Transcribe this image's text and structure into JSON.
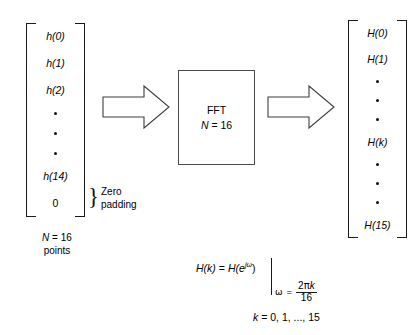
{
  "diagram": {
    "input_vector": {
      "name": "input-sequence",
      "items": [
        {
          "type": "text",
          "label": "h(0)"
        },
        {
          "type": "text",
          "label": "h(1)"
        },
        {
          "type": "text",
          "label": "h(2)"
        },
        {
          "type": "dot",
          "label": ""
        },
        {
          "type": "dot",
          "label": ""
        },
        {
          "type": "dot",
          "label": ""
        },
        {
          "type": "text",
          "label": "h(14)"
        },
        {
          "type": "zero",
          "label": "0"
        }
      ],
      "brace_symbol": "}",
      "brace_label_line1": "Zero",
      "brace_label_line2": "padding",
      "caption_line1": "N = 16",
      "caption_line2": "points",
      "caption_italic_part": "N",
      "caption_rest": " = 16"
    },
    "processor": {
      "name": "fft-block",
      "title": "FFT",
      "size_label_italic": "N",
      "size_label_rest": " = 16"
    },
    "arrows": {
      "input_arrow_label": "input-arrow",
      "output_arrow_label": "output-arrow"
    },
    "output_vector": {
      "name": "output-spectrum",
      "items": [
        {
          "type": "text",
          "label": "H(0)"
        },
        {
          "type": "text",
          "label": "H(1)"
        },
        {
          "type": "dot",
          "label": ""
        },
        {
          "type": "dot",
          "label": ""
        },
        {
          "type": "dot",
          "label": ""
        },
        {
          "type": "text",
          "label": "H(k)"
        },
        {
          "type": "dot",
          "label": ""
        },
        {
          "type": "dot",
          "label": ""
        },
        {
          "type": "dot",
          "label": ""
        },
        {
          "type": "text",
          "label": "H(15)"
        }
      ]
    },
    "equation": {
      "lhs": "H(k)",
      "equals": "=",
      "rhs_base": "H(e",
      "rhs_exponent": "jω",
      "rhs_close": ")",
      "evaluated_at_variable": "ω",
      "evaluated_at_equals": "=",
      "numerator": "2πk",
      "numerator_coeff": "2",
      "numerator_pi": "π",
      "numerator_k": "k",
      "denominator": "16",
      "index_range": "k = 0, 1, ..., 15",
      "index_variable": "k",
      "index_values": " = 0, 1, ..., 15"
    },
    "colors": {
      "background": "#ffffff",
      "ink": "#1a1a1a",
      "box_stroke": "#4a4a4a"
    }
  }
}
